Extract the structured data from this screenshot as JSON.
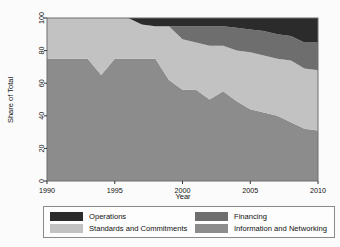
{
  "chart_data": {
    "type": "area",
    "stacked": true,
    "title": "",
    "xlabel": "Year",
    "ylabel": "Share of Total",
    "xlim": [
      1990,
      2010
    ],
    "ylim": [
      0,
      100
    ],
    "grid": false,
    "legend_position": "bottom",
    "xticks": [
      1990,
      1995,
      2000,
      2005,
      2010
    ],
    "yticks": [
      0,
      20,
      40,
      60,
      80,
      100
    ],
    "x": [
      1990,
      1991,
      1992,
      1993,
      1994,
      1995,
      1996,
      1997,
      1998,
      1999,
      2000,
      2001,
      2002,
      2003,
      2004,
      2005,
      2006,
      2007,
      2008,
      2009,
      2010
    ],
    "series": [
      {
        "name": "Financing",
        "color": "#8c8c8c",
        "values": [
          75,
          75,
          75,
          75,
          65,
          75,
          75,
          75,
          75,
          62,
          56,
          56,
          50,
          55,
          49,
          44,
          42,
          40,
          36,
          32,
          31
        ]
      },
      {
        "name": "Standards and Commitments",
        "color": "#c2c2c2",
        "values": [
          25,
          25,
          25,
          25,
          35,
          25,
          25,
          21,
          20,
          33,
          31,
          29,
          33,
          28,
          31,
          35,
          35,
          35,
          38,
          37,
          37
        ]
      },
      {
        "name": "Information and Networking",
        "color": "#6e6e6e",
        "values": [
          0,
          0,
          0,
          0,
          0,
          0,
          0,
          0,
          0,
          0,
          8,
          10,
          12,
          12,
          14,
          14,
          15,
          15,
          15,
          16,
          17
        ]
      },
      {
        "name": "Operations",
        "color": "#2b2b2b",
        "values": [
          0,
          0,
          0,
          0,
          0,
          0,
          0,
          4,
          5,
          5,
          5,
          5,
          5,
          5,
          6,
          7,
          8,
          10,
          11,
          15,
          15
        ]
      }
    ]
  },
  "legend": {
    "entries": [
      {
        "label": "Operations",
        "color": "#2b2b2b"
      },
      {
        "label": "Financing",
        "color": "#6e6e6e"
      },
      {
        "label": "Standards and Commitments",
        "color": "#c2c2c2"
      },
      {
        "label": "Information and Networking",
        "color": "#8c8c8c"
      }
    ]
  }
}
